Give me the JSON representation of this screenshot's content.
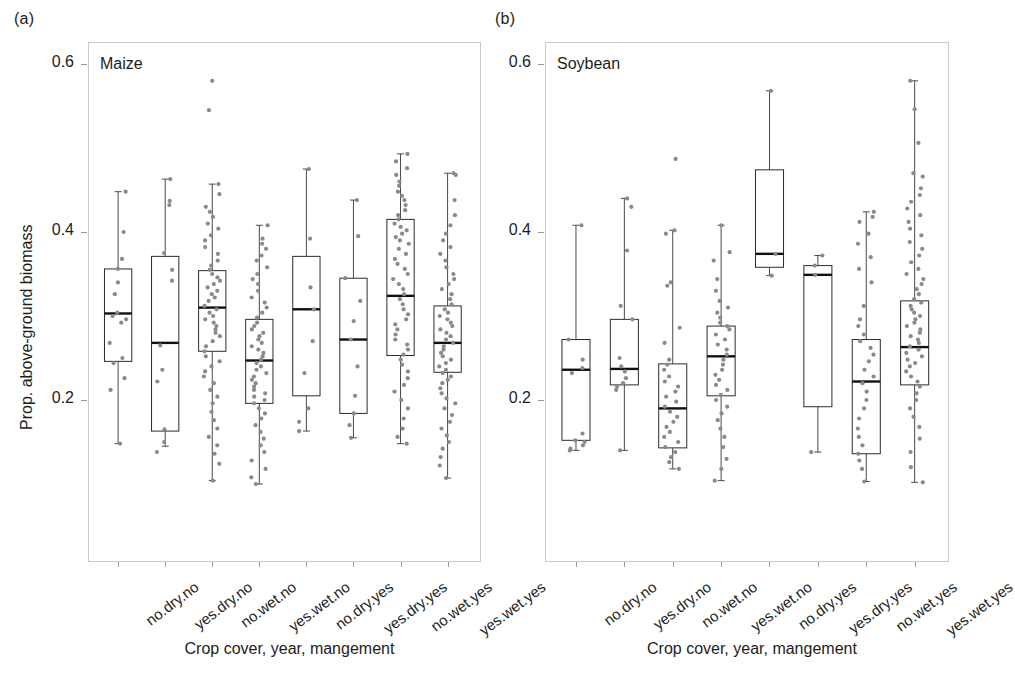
{
  "figure": {
    "background": "#ffffff",
    "point_color": "#8a8a8a",
    "box_color": "#2b2b2b",
    "median_color": "#111111",
    "frame_color": "#c9c9cf"
  },
  "panels": [
    {
      "tag": "(a)",
      "title": "Maize",
      "xlabel": "Crop cover, year, mangement",
      "ylabel": "Prop. above-ground biomass"
    },
    {
      "tag": "(b)",
      "title": "Soybean",
      "xlabel": "Crop cover, year, mangement",
      "ylabel": ""
    }
  ],
  "chart_data": [
    {
      "type": "box",
      "title": "Maize",
      "panel": "(a)",
      "xlabel": "Crop cover, year, mangement",
      "ylabel": "Prop. above-ground biomass",
      "ylim": [
        0.07,
        0.62
      ],
      "yticks": [
        0.2,
        0.4,
        0.6
      ],
      "ytick_labels": [
        "0.2",
        "0.4",
        "0.6"
      ],
      "grid": false,
      "legend": "none",
      "categories": [
        "no.dry.no",
        "yes.dry.no",
        "no.wet.no",
        "yes.wet.no",
        "no.dry.yes",
        "yes.dry.yes",
        "no.wet.yes",
        "yes.wet.yes"
      ],
      "boxes": [
        {
          "category": "no.dry.no",
          "whisker_low": 0.148,
          "q1": 0.246,
          "median": 0.303,
          "q3": 0.356,
          "whisker_high": 0.448
        },
        {
          "category": "yes.dry.no",
          "whisker_low": 0.145,
          "q1": 0.163,
          "median": 0.268,
          "q3": 0.371,
          "whisker_high": 0.463
        },
        {
          "category": "no.wet.no",
          "whisker_low": 0.104,
          "q1": 0.258,
          "median": 0.31,
          "q3": 0.354,
          "whisker_high": 0.457
        },
        {
          "category": "yes.wet.no",
          "whisker_low": 0.1,
          "q1": 0.196,
          "median": 0.247,
          "q3": 0.296,
          "whisker_high": 0.408
        },
        {
          "category": "no.dry.yes",
          "whisker_low": 0.163,
          "q1": 0.205,
          "median": 0.308,
          "q3": 0.371,
          "whisker_high": 0.475
        },
        {
          "category": "yes.dry.yes",
          "whisker_low": 0.155,
          "q1": 0.184,
          "median": 0.272,
          "q3": 0.345,
          "whisker_high": 0.438
        },
        {
          "category": "no.wet.yes",
          "whisker_low": 0.148,
          "q1": 0.253,
          "median": 0.324,
          "q3": 0.415,
          "whisker_high": 0.493
        },
        {
          "category": "yes.wet.yes",
          "whisker_low": 0.107,
          "q1": 0.233,
          "median": 0.268,
          "q3": 0.312,
          "whisker_high": 0.47
        }
      ],
      "points": {
        "no.dry.no": [
          0.448,
          0.4,
          0.368,
          0.356,
          0.34,
          0.326,
          0.304,
          0.3,
          0.296,
          0.292,
          0.268,
          0.25,
          0.244,
          0.226,
          0.212,
          0.148
        ],
        "yes.dry.no": [
          0.463,
          0.437,
          0.432,
          0.375,
          0.355,
          0.342,
          0.265,
          0.236,
          0.222,
          0.165,
          0.15,
          0.138
        ],
        "no.wet.no": [
          0.545,
          0.58,
          0.457,
          0.445,
          0.43,
          0.424,
          0.418,
          0.41,
          0.404,
          0.396,
          0.39,
          0.382,
          0.374,
          0.366,
          0.36,
          0.355,
          0.35,
          0.346,
          0.342,
          0.338,
          0.334,
          0.33,
          0.326,
          0.322,
          0.318,
          0.312,
          0.308,
          0.304,
          0.3,
          0.296,
          0.292,
          0.288,
          0.284,
          0.28,
          0.276,
          0.27,
          0.264,
          0.258,
          0.252,
          0.246,
          0.24,
          0.234,
          0.228,
          0.22,
          0.212,
          0.204,
          0.196,
          0.186,
          0.176,
          0.166,
          0.156,
          0.146,
          0.136,
          0.124,
          0.104
        ],
        "yes.wet.no": [
          0.408,
          0.392,
          0.386,
          0.38,
          0.372,
          0.366,
          0.358,
          0.35,
          0.344,
          0.338,
          0.33,
          0.322,
          0.316,
          0.31,
          0.304,
          0.298,
          0.292,
          0.288,
          0.284,
          0.28,
          0.276,
          0.272,
          0.268,
          0.264,
          0.26,
          0.256,
          0.252,
          0.248,
          0.244,
          0.24,
          0.236,
          0.232,
          0.228,
          0.224,
          0.22,
          0.216,
          0.212,
          0.208,
          0.204,
          0.2,
          0.196,
          0.19,
          0.184,
          0.178,
          0.17,
          0.162,
          0.154,
          0.146,
          0.138,
          0.128,
          0.118,
          0.108,
          0.1
        ],
        "no.dry.yes": [
          0.475,
          0.392,
          0.334,
          0.308,
          0.27,
          0.232,
          0.19,
          0.174,
          0.163
        ],
        "yes.dry.yes": [
          0.438,
          0.395,
          0.345,
          0.318,
          0.294,
          0.272,
          0.24,
          0.205,
          0.184,
          0.17,
          0.155
        ],
        "no.wet.yes": [
          0.493,
          0.484,
          0.476,
          0.468,
          0.46,
          0.455,
          0.448,
          0.443,
          0.438,
          0.432,
          0.426,
          0.42,
          0.415,
          0.41,
          0.406,
          0.402,
          0.398,
          0.394,
          0.39,
          0.386,
          0.38,
          0.374,
          0.368,
          0.362,
          0.356,
          0.35,
          0.344,
          0.338,
          0.332,
          0.326,
          0.32,
          0.314,
          0.308,
          0.302,
          0.296,
          0.29,
          0.284,
          0.278,
          0.272,
          0.266,
          0.26,
          0.254,
          0.248,
          0.242,
          0.234,
          0.226,
          0.218,
          0.21,
          0.2,
          0.19,
          0.178,
          0.166,
          0.156,
          0.148
        ],
        "yes.wet.yes": [
          0.47,
          0.468,
          0.438,
          0.42,
          0.408,
          0.398,
          0.39,
          0.382,
          0.374,
          0.366,
          0.358,
          0.35,
          0.344,
          0.338,
          0.332,
          0.326,
          0.32,
          0.314,
          0.308,
          0.304,
          0.3,
          0.296,
          0.292,
          0.288,
          0.284,
          0.28,
          0.276,
          0.272,
          0.268,
          0.264,
          0.26,
          0.256,
          0.252,
          0.248,
          0.244,
          0.24,
          0.236,
          0.232,
          0.228,
          0.224,
          0.22,
          0.214,
          0.208,
          0.202,
          0.196,
          0.19,
          0.182,
          0.174,
          0.166,
          0.158,
          0.15,
          0.142,
          0.132,
          0.122,
          0.107
        ]
      }
    },
    {
      "type": "box",
      "title": "Soybean",
      "panel": "(b)",
      "xlabel": "Crop cover, year, mangement",
      "ylabel": "",
      "ylim": [
        0.07,
        0.62
      ],
      "yticks": [
        0.2,
        0.4,
        0.6
      ],
      "ytick_labels": [
        "0.2",
        "0.4",
        "0.6"
      ],
      "grid": false,
      "legend": "none",
      "categories": [
        "no.dry.no",
        "yes.dry.no",
        "no.wet.no",
        "yes.wet.no",
        "no.dry.yes",
        "yes.dry.yes",
        "no.wet.yes",
        "yes.wet.yes"
      ],
      "boxes": [
        {
          "category": "no.dry.no",
          "whisker_low": 0.14,
          "q1": 0.152,
          "median": 0.236,
          "q3": 0.272,
          "whisker_high": 0.408
        },
        {
          "category": "yes.dry.no",
          "whisker_low": 0.14,
          "q1": 0.218,
          "median": 0.237,
          "q3": 0.296,
          "whisker_high": 0.44
        },
        {
          "category": "no.wet.no",
          "whisker_low": 0.118,
          "q1": 0.143,
          "median": 0.19,
          "q3": 0.243,
          "whisker_high": 0.402
        },
        {
          "category": "yes.wet.no",
          "whisker_low": 0.104,
          "q1": 0.205,
          "median": 0.252,
          "q3": 0.288,
          "whisker_high": 0.408
        },
        {
          "category": "no.dry.yes",
          "whisker_low": 0.348,
          "q1": 0.358,
          "median": 0.374,
          "q3": 0.474,
          "whisker_high": 0.568
        },
        {
          "category": "yes.dry.yes",
          "whisker_low": 0.138,
          "q1": 0.192,
          "median": 0.349,
          "q3": 0.36,
          "whisker_high": 0.372
        },
        {
          "category": "no.wet.yes",
          "whisker_low": 0.103,
          "q1": 0.136,
          "median": 0.222,
          "q3": 0.272,
          "whisker_high": 0.424
        },
        {
          "category": "yes.wet.yes",
          "whisker_low": 0.102,
          "q1": 0.218,
          "median": 0.263,
          "q3": 0.318,
          "whisker_high": 0.58
        }
      ],
      "points": {
        "no.dry.no": [
          0.408,
          0.272,
          0.248,
          0.238,
          0.232,
          0.16,
          0.152,
          0.15,
          0.146,
          0.142,
          0.14
        ],
        "yes.dry.no": [
          0.44,
          0.43,
          0.378,
          0.312,
          0.296,
          0.25,
          0.24,
          0.234,
          0.226,
          0.22,
          0.216,
          0.212,
          0.14
        ],
        "no.wet.no": [
          0.487,
          0.402,
          0.398,
          0.34,
          0.336,
          0.286,
          0.268,
          0.248,
          0.242,
          0.236,
          0.228,
          0.222,
          0.216,
          0.21,
          0.204,
          0.198,
          0.192,
          0.186,
          0.18,
          0.174,
          0.168,
          0.162,
          0.156,
          0.15,
          0.144,
          0.138,
          0.132,
          0.126,
          0.118
        ],
        "yes.wet.no": [
          0.408,
          0.376,
          0.366,
          0.344,
          0.33,
          0.318,
          0.31,
          0.304,
          0.298,
          0.292,
          0.288,
          0.284,
          0.278,
          0.272,
          0.266,
          0.26,
          0.254,
          0.248,
          0.242,
          0.236,
          0.23,
          0.224,
          0.218,
          0.212,
          0.206,
          0.2,
          0.192,
          0.184,
          0.176,
          0.166,
          0.156,
          0.144,
          0.13,
          0.118,
          0.104
        ],
        "no.dry.yes": [
          0.568,
          0.374,
          0.348
        ],
        "yes.dry.yes": [
          0.372,
          0.36,
          0.349,
          0.138
        ],
        "no.wet.yes": [
          0.424,
          0.418,
          0.412,
          0.398,
          0.386,
          0.37,
          0.356,
          0.34,
          0.312,
          0.296,
          0.288,
          0.278,
          0.27,
          0.262,
          0.254,
          0.246,
          0.236,
          0.228,
          0.22,
          0.21,
          0.2,
          0.19,
          0.178,
          0.166,
          0.156,
          0.146,
          0.136,
          0.128,
          0.118,
          0.103
        ],
        "yes.wet.yes": [
          0.58,
          0.546,
          0.506,
          0.47,
          0.466,
          0.452,
          0.444,
          0.436,
          0.428,
          0.42,
          0.412,
          0.404,
          0.396,
          0.388,
          0.38,
          0.372,
          0.364,
          0.356,
          0.35,
          0.344,
          0.338,
          0.332,
          0.326,
          0.32,
          0.316,
          0.312,
          0.308,
          0.304,
          0.3,
          0.296,
          0.292,
          0.288,
          0.284,
          0.28,
          0.276,
          0.272,
          0.268,
          0.264,
          0.26,
          0.256,
          0.252,
          0.248,
          0.244,
          0.24,
          0.234,
          0.228,
          0.222,
          0.216,
          0.208,
          0.2,
          0.19,
          0.18,
          0.168,
          0.154,
          0.138,
          0.12,
          0.102
        ]
      }
    }
  ]
}
